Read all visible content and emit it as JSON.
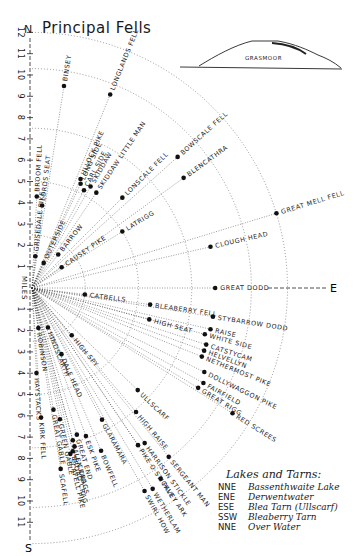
{
  "title": "Principal Fells",
  "north_label": "N",
  "south_label": "S",
  "east_label": "E",
  "axis_label": "MILES",
  "scale_ticks_north": [
    "1",
    "2",
    "3",
    "4",
    "5",
    "6",
    "7",
    "8",
    "9",
    "10",
    "11",
    "12"
  ],
  "scale_ticks_south": [
    "1",
    "2",
    "3",
    "4",
    "5",
    "6",
    "7",
    "8",
    "9",
    "10",
    "11"
  ],
  "inset": {
    "label": "GRASMOOR"
  },
  "fells": [
    {
      "name": "BINSEY",
      "dist": 9.6,
      "bearing": 9
    },
    {
      "name": "LONGLANDS FELL",
      "dist": 9.8,
      "bearing": 22
    },
    {
      "name": "BROOM FELL",
      "dist": 4.3,
      "bearing": 3
    },
    {
      "name": "LORDS SEAT",
      "dist": 3.9,
      "bearing": 7
    },
    {
      "name": "GRISEDALE PIKE",
      "dist": 1.5,
      "bearing": 6
    },
    {
      "name": "ULLOCK PIKE",
      "dist": 5.6,
      "bearing": 24
    },
    {
      "name": "LONG SIDE",
      "dist": 5.4,
      "bearing": 25
    },
    {
      "name": "SKIDDAW",
      "dist": 5.5,
      "bearing": 30
    },
    {
      "name": "CARL SIDE",
      "dist": 5.2,
      "bearing": 28
    },
    {
      "name": "SKIDDAW LITTLE MAN",
      "dist": 5.4,
      "bearing": 34
    },
    {
      "name": "LONSCALE FELL",
      "dist": 6.0,
      "bearing": 45
    },
    {
      "name": "BOWSCALE FELL",
      "dist": 9.2,
      "bearing": 48
    },
    {
      "name": "BLENCATHRA",
      "dist": 8.8,
      "bearing": 54
    },
    {
      "name": "LATRIGG",
      "dist": 5.0,
      "bearing": 58
    },
    {
      "name": "GREAT MELL FELL",
      "dist": 12.0,
      "bearing": 73
    },
    {
      "name": "OUTERSIDE",
      "dist": 1.3,
      "bearing": 25
    },
    {
      "name": "BARROW",
      "dist": 2.0,
      "bearing": 38
    },
    {
      "name": "CAUSEY PIKE",
      "dist": 1.7,
      "bearing": 55
    },
    {
      "name": "CLOUGH HEAD",
      "dist": 8.6,
      "bearing": 77
    },
    {
      "name": "GREAT DODD",
      "dist": 8.6,
      "bearing": 90
    },
    {
      "name": "CATBELLS",
      "dist": 2.5,
      "bearing": 97
    },
    {
      "name": "BLEABERRY FELL",
      "dist": 5.6,
      "bearing": 98
    },
    {
      "name": "STYBARROW DODD",
      "dist": 8.6,
      "bearing": 99
    },
    {
      "name": "HIGH SEAT",
      "dist": 5.7,
      "bearing": 105
    },
    {
      "name": "RAISE",
      "dist": 8.6,
      "bearing": 103
    },
    {
      "name": "WHITE SIDE",
      "dist": 8.4,
      "bearing": 105
    },
    {
      "name": "CATSTYCAM",
      "dist": 8.6,
      "bearing": 108
    },
    {
      "name": "HELVELLYN",
      "dist": 8.6,
      "bearing": 110
    },
    {
      "name": "NETHERMOST PIKE",
      "dist": 8.6,
      "bearing": 112
    },
    {
      "name": "DOLLYWAGGON PIKE",
      "dist": 9.0,
      "bearing": 116
    },
    {
      "name": "FAIRFIELD",
      "dist": 9.2,
      "bearing": 119
    },
    {
      "name": "GREAT RIGG",
      "dist": 9.1,
      "bearing": 121
    },
    {
      "name": "RED SCREES",
      "dist": 11.1,
      "bearing": 122
    },
    {
      "name": "ROBINSON",
      "dist": 1.9,
      "bearing": 171
    },
    {
      "name": "HINDSCARTH",
      "dist": 2.0,
      "bearing": 158
    },
    {
      "name": "DALE HEAD",
      "dist": 3.4,
      "bearing": 156
    },
    {
      "name": "HIGH SPY",
      "dist": 2.9,
      "bearing": 140
    },
    {
      "name": "ULLSCARF",
      "dist": 6.9,
      "bearing": 134
    },
    {
      "name": "HIGH RAISE",
      "dist": 7.6,
      "bearing": 140
    },
    {
      "name": "HARRISON STICKLE",
      "dist": 9.0,
      "bearing": 144
    },
    {
      "name": "PIKE O STICKLE",
      "dist": 8.9,
      "bearing": 146
    },
    {
      "name": "GLARAMARA",
      "dist": 7.0,
      "bearing": 152
    },
    {
      "name": "ROSSETT PIKE (unlabeled)",
      "dist": 0,
      "bearing": 0
    },
    {
      "name": "PAVEY ARK",
      "dist": 10.8,
      "bearing": 146
    },
    {
      "name": "SERGEANT MAN",
      "dist": 10.2,
      "bearing": 141
    },
    {
      "name": "HAYSTACKS",
      "dist": 4.0,
      "bearing": 177
    },
    {
      "name": "KIRK FELL",
      "dist": 6.1,
      "bearing": 176
    },
    {
      "name": "GREAT GABLE",
      "dist": 5.8,
      "bearing": 170
    },
    {
      "name": "GREEN GABLE",
      "dist": 6.3,
      "bearing": 168
    },
    {
      "name": "GREAT END",
      "dist": 7.2,
      "bearing": 163
    },
    {
      "name": "ESK PIKE",
      "dist": 7.4,
      "bearing": 160
    },
    {
      "name": "BOWFELL",
      "dist": 8.3,
      "bearing": 157
    },
    {
      "name": "ALLEN CRAGS",
      "dist": 7.4,
      "bearing": 165
    },
    {
      "name": "BROAD CRAG",
      "dist": 7.9,
      "bearing": 166
    },
    {
      "name": "ILL CRAG",
      "dist": 7.7,
      "bearing": 165
    },
    {
      "name": "SCAFELL PIKE",
      "dist": 8.0,
      "bearing": 167
    },
    {
      "name": "SCAFELL",
      "dist": 8.6,
      "bearing": 171
    },
    {
      "name": "WETHERLAM",
      "dist": 11.0,
      "bearing": 149
    },
    {
      "name": "SWIRL HOW",
      "dist": 10.9,
      "bearing": 151
    }
  ],
  "legend": {
    "heading": "Lakes and Tarns:",
    "items": [
      {
        "code": "NNE",
        "name": "Bassenthwaite Lake"
      },
      {
        "code": "ENE",
        "name": "Derwentwater"
      },
      {
        "code": "ESE",
        "name": "Blea Tarn (Ullscarf)"
      },
      {
        "code": "SSW",
        "name": "Bleaberry Tarn"
      },
      {
        "code": "NNE",
        "name": "Over Water"
      }
    ]
  }
}
